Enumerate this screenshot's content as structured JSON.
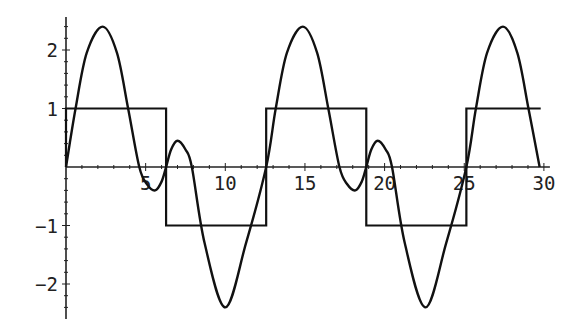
{
  "chart_data": {
    "type": "line",
    "title": "",
    "xlabel": "",
    "ylabel": "",
    "xlim": [
      0,
      30
    ],
    "ylim": [
      -2.6,
      2.6
    ],
    "grid": false,
    "legend": null,
    "x_ticks": [
      5,
      10,
      15,
      20,
      25,
      30
    ],
    "x_tick_labels": [
      "5",
      "10",
      "15",
      "20",
      "25",
      "30"
    ],
    "y_ticks": [
      -2,
      -1,
      1,
      2
    ],
    "y_tick_labels": [
      "-2",
      "-1",
      "1",
      "2"
    ],
    "series": [
      {
        "name": "square-wave",
        "kind": "step",
        "period": 12.566,
        "amplitude": 1,
        "transitions": [
          6.283,
          12.566,
          18.85,
          25.133
        ],
        "segments": [
          {
            "x0": 0,
            "x1": 6.283,
            "y": 1
          },
          {
            "x0": 6.283,
            "x1": 12.566,
            "y": -1
          },
          {
            "x0": 12.566,
            "x1": 18.85,
            "y": 1
          },
          {
            "x0": 18.85,
            "x1": 25.133,
            "y": -1
          },
          {
            "x0": 25.133,
            "x1": 29.8,
            "y": 1
          }
        ]
      },
      {
        "name": "smooth-curve",
        "kind": "spline-through-digitized-points",
        "period": 12.566,
        "peak_max": 2.4,
        "peak_min": -2.4,
        "note": "points digitized from image; underlying formula unknown",
        "points_one_period": [
          [
            0,
            0
          ],
          [
            0.6,
            1.0
          ],
          [
            1.3,
            1.95
          ],
          [
            2.3,
            2.4
          ],
          [
            3.2,
            1.95
          ],
          [
            3.9,
            1.0
          ],
          [
            4.6,
            0
          ],
          [
            5.1,
            -0.3
          ],
          [
            5.6,
            -0.4
          ],
          [
            6.0,
            -0.25
          ],
          [
            6.283,
            0
          ],
          [
            6.6,
            0.3
          ],
          [
            7.0,
            0.45
          ],
          [
            7.5,
            0.3
          ],
          [
            7.9,
            0
          ],
          [
            8.7,
            -1.3
          ],
          [
            10.0,
            -2.4
          ],
          [
            11.3,
            -1.3
          ],
          [
            12.566,
            0
          ]
        ],
        "x_end": 29.8
      }
    ]
  },
  "colors": {
    "background": "#ffffff",
    "line": "#111111",
    "axis": "#222222"
  }
}
